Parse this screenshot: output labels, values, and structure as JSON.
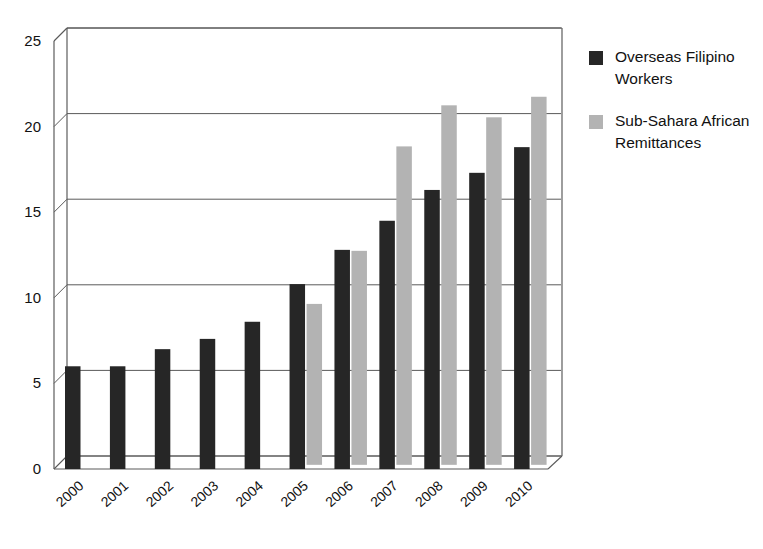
{
  "chart_data": {
    "type": "bar",
    "title": "",
    "subtitle": "",
    "xlabel": "",
    "ylabel": "",
    "categories": [
      "2000",
      "2001",
      "2002",
      "2003",
      "2004",
      "2005",
      "2006",
      "2007",
      "2008",
      "2009",
      "2010"
    ],
    "series": [
      {
        "name": "Overseas Filipino Workers",
        "color": "#262626",
        "values": [
          6.0,
          6.0,
          7.0,
          7.6,
          8.6,
          10.8,
          12.8,
          14.5,
          16.3,
          17.3,
          18.8
        ]
      },
      {
        "name": "Sub-Sahara African Remittances",
        "color": "#b3b3b3",
        "values": [
          null,
          null,
          null,
          null,
          null,
          9.4,
          12.5,
          18.6,
          21.0,
          20.3,
          21.5
        ]
      }
    ],
    "ylim": [
      0,
      25
    ],
    "yticks": [
      0,
      5,
      10,
      15,
      20,
      25
    ],
    "ytick_labels": [
      "0",
      "5",
      "10",
      "15",
      "20",
      "25"
    ],
    "grid": true,
    "grid_axis": "y",
    "legend_position": "right",
    "style": "3d-perspective"
  },
  "legend": {
    "items": [
      {
        "label": "Overseas Filipino Workers",
        "color": "#262626",
        "swatch": "legend-swatch-dark"
      },
      {
        "label": "Sub-Sahara African Remittances",
        "color": "#b3b3b3",
        "swatch": "legend-swatch-gray"
      }
    ]
  },
  "axes": {
    "y": {
      "ticks": [
        "25",
        "20",
        "15",
        "10",
        "5",
        "0"
      ]
    },
    "x": {
      "ticks": [
        "2000",
        "2001",
        "2002",
        "2003",
        "2004",
        "2005",
        "2006",
        "2007",
        "2008",
        "2009",
        "2010"
      ]
    }
  }
}
